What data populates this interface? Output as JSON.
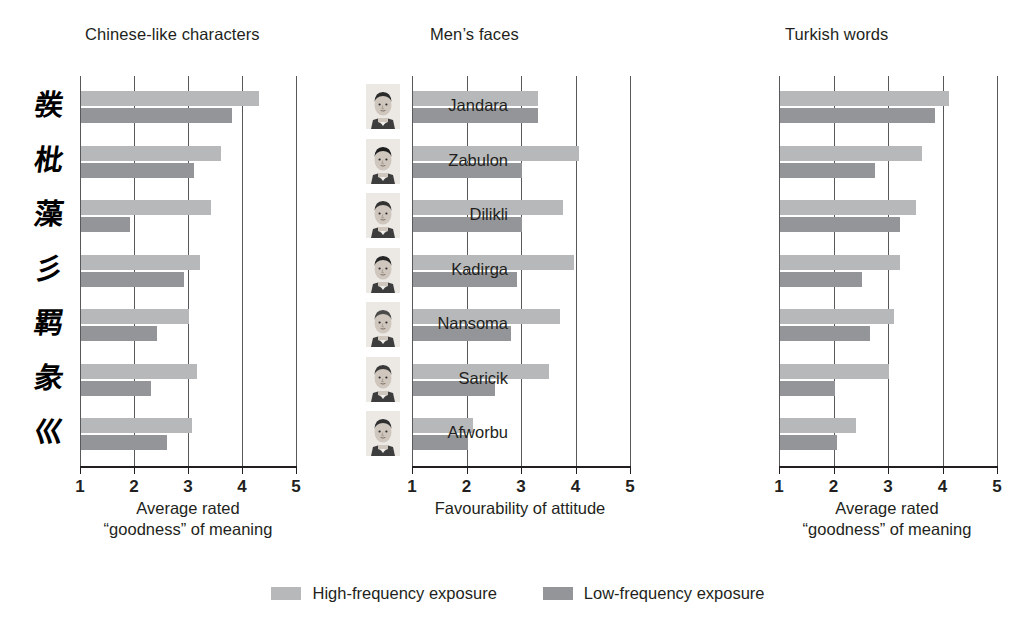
{
  "chart_data": {
    "type": "bar",
    "title": "",
    "orientation": "horizontal",
    "grid": true,
    "legend_position": "bottom",
    "series_names": [
      "High-frequency exposure",
      "Low-frequency exposure"
    ],
    "series_colors": [
      "#b6b8ba",
      "#939598"
    ],
    "panels": [
      {
        "title": "Chinese-like characters",
        "xlabel_line1": "Average rated",
        "xlabel_line2": "“goodness” of meaning",
        "xlim": [
          1,
          5
        ],
        "xticks": [
          "1",
          "2",
          "3",
          "4",
          "5"
        ],
        "categories": [
          "char-1",
          "char-2",
          "char-3",
          "char-4",
          "char-5",
          "char-6",
          "char-7"
        ],
        "category_glyphs": [
          "彂",
          "枇",
          "藻",
          "彡",
          "羁",
          "彖",
          "巛"
        ],
        "series": [
          {
            "name": "High-frequency exposure",
            "values": [
              4.3,
              3.6,
              3.4,
              3.2,
              3.0,
              3.15,
              3.05
            ]
          },
          {
            "name": "Low-frequency exposure",
            "values": [
              3.8,
              3.1,
              1.9,
              2.9,
              2.4,
              2.3,
              2.6
            ]
          }
        ]
      },
      {
        "title": "Men’s faces",
        "xlabel_line1": "Favourability of attitude",
        "xlabel_line2": "",
        "xlim": [
          1,
          5
        ],
        "xticks": [
          "1",
          "2",
          "3",
          "4",
          "5"
        ],
        "categories": [
          "face-1",
          "face-2",
          "face-3",
          "face-4",
          "face-5",
          "face-6",
          "face-7"
        ],
        "series": [
          {
            "name": "High-frequency exposure",
            "values": [
              3.3,
              4.05,
              3.75,
              3.95,
              3.7,
              3.5,
              2.1
            ]
          },
          {
            "name": "Low-frequency exposure",
            "values": [
              3.3,
              3.0,
              3.0,
              2.9,
              2.8,
              2.5,
              2.0
            ]
          }
        ]
      },
      {
        "title": "Turkish words",
        "xlabel_line1": "Average rated",
        "xlabel_line2": "“goodness” of meaning",
        "xlim": [
          1,
          5
        ],
        "xticks": [
          "1",
          "2",
          "3",
          "4",
          "5"
        ],
        "categories": [
          "Jandara",
          "Zabulon",
          "Dilikli",
          "Kadirga",
          "Nansoma",
          "Saricik",
          "Afworbu"
        ],
        "series": [
          {
            "name": "High-frequency exposure",
            "values": [
              4.1,
              3.6,
              3.5,
              3.2,
              3.1,
              3.0,
              2.4
            ]
          },
          {
            "name": "Low-frequency exposure",
            "values": [
              3.85,
              2.75,
              3.2,
              2.5,
              2.65,
              2.0,
              2.05
            ]
          }
        ]
      }
    ]
  },
  "legend": {
    "items": [
      {
        "label": "High-frequency exposure",
        "swatch": "high-frequency-swatch"
      },
      {
        "label": "Low-frequency exposure",
        "swatch": "low-frequency-swatch"
      }
    ]
  }
}
